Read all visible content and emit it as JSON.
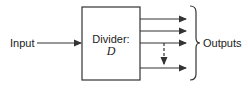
{
  "diagram": {
    "input_label": "Input",
    "block": {
      "title": "Divider:",
      "symbol": "D"
    },
    "outputs_label": "Outputs",
    "output_count_solid": 4,
    "dashed_connector": "between output 3 and output 4",
    "colors": {
      "stroke": "#333333",
      "background": "#ffffff",
      "text": "#222222"
    }
  }
}
